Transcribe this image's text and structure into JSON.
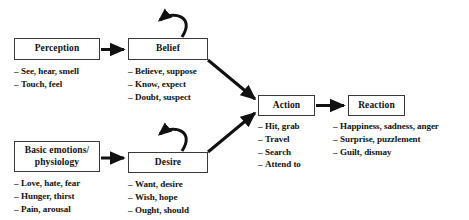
{
  "diagram": {
    "background_color": "#ffffff",
    "line_color": "#111111",
    "box_border_color": "#3a3a3a",
    "nodes": {
      "perception": {
        "label": "Perception",
        "items": [
          "See, hear, smell",
          "Touch, feel"
        ]
      },
      "belief": {
        "label": "Belief",
        "items": [
          "Believe, suppose",
          "Know, expect",
          "Doubt, suspect"
        ]
      },
      "basic_emotions": {
        "label": "Basic emotions/\nphysiology",
        "items": [
          "Love, hate, fear",
          "Hunger, thirst",
          "Pain, arousal"
        ]
      },
      "desire": {
        "label": "Desire",
        "items": [
          "Want, desire",
          "Wish, hope",
          "Ought, should"
        ]
      },
      "action": {
        "label": "Action",
        "items": [
          "Hit, grab",
          "Travel",
          "Search",
          "Attend to"
        ]
      },
      "reaction": {
        "label": "Reaction",
        "items": [
          "Happiness, sadness, anger",
          "Surprise, puzzlement",
          "Guilt, dismay"
        ]
      }
    },
    "edges": [
      {
        "name": "perception-to-belief",
        "from": "perception",
        "to": "belief",
        "kind": "arrow"
      },
      {
        "name": "basic-emotions-to-desire",
        "from": "basic_emotions",
        "to": "desire",
        "kind": "arrow"
      },
      {
        "name": "belief-to-action",
        "from": "belief",
        "to": "action",
        "kind": "arrow"
      },
      {
        "name": "desire-to-action",
        "from": "desire",
        "to": "action",
        "kind": "arrow"
      },
      {
        "name": "action-to-reaction",
        "from": "action",
        "to": "reaction",
        "kind": "arrow"
      },
      {
        "name": "belief-self-loop",
        "from": "belief",
        "to": "belief",
        "kind": "self-loop"
      },
      {
        "name": "desire-self-loop",
        "from": "desire",
        "to": "desire",
        "kind": "self-loop"
      }
    ],
    "bullet_dash": "–"
  }
}
